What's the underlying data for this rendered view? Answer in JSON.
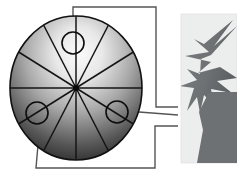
{
  "figure": {
    "width": 237,
    "height": 176,
    "background_color": "#ffffff"
  },
  "colors": {
    "background": "#ffffff",
    "disc_light": "#f2f2f2",
    "disc_mid": "#9a9a9a",
    "disc_dark": "#2b2b2b",
    "disc_edge": "#111111",
    "sector_line": "#141414",
    "marker_circle_stroke": "#0d0d0d",
    "callout_line": "#555555",
    "panel_fill": "#eceded",
    "panel_edge": "#e3e4e4",
    "burst_fill": "#6e7173",
    "burst_fill_dark": "#5d6063"
  },
  "disc": {
    "name": "sectored-disc",
    "center_x": 76,
    "center_y": 88,
    "radius_x": 66,
    "radius_y": 72,
    "sector_count": 12,
    "hub_radius": 3,
    "gradient": {
      "type": "radial",
      "highlight_x": 82,
      "highlight_y": 52,
      "stops": [
        {
          "offset": 0.0,
          "color": "#fbfbfb"
        },
        {
          "offset": 0.22,
          "color": "#e8e8e8"
        },
        {
          "offset": 0.5,
          "color": "#a8a8a8"
        },
        {
          "offset": 0.78,
          "color": "#565656"
        },
        {
          "offset": 1.0,
          "color": "#1f1f1f"
        }
      ]
    },
    "sector_angles_deg": [
      90,
      120,
      150,
      180,
      210,
      240,
      270,
      300,
      330,
      0,
      30,
      60
    ]
  },
  "markers": [
    {
      "name": "marker-circle-top",
      "label": "1",
      "cx": 73,
      "cy": 43,
      "r": 11
    },
    {
      "name": "marker-circle-lower-left",
      "label": "2",
      "cx": 37,
      "cy": 113,
      "r": 11
    },
    {
      "name": "marker-circle-lower-right",
      "label": "3",
      "cx": 117,
      "cy": 112,
      "r": 11
    }
  ],
  "callouts": [
    {
      "name": "callout-top",
      "from_marker": "marker-circle-top",
      "path": "M 73 34 L 73 7 L 156 7 L 156 107 L 178 107",
      "terminal_x": 178,
      "terminal_y": 107
    },
    {
      "name": "callout-right",
      "from_marker": "marker-circle-lower-right",
      "path": "M 126 110 L 178 115",
      "terminal_x": 178,
      "terminal_y": 115
    },
    {
      "name": "callout-bottom",
      "from_marker": "marker-circle-lower-left",
      "path": "M 40 122 L 36 168 L 155 168 L 155 126 L 178 126",
      "terminal_x": 178,
      "terminal_y": 126
    }
  ],
  "inset_panel": {
    "name": "starburst-inset-panel",
    "x": 181,
    "y": 14,
    "width": 56,
    "height": 149
  },
  "burst": {
    "name": "starburst-shape",
    "description": "irregular dark gray explosion/star burst, cropped at panel right edge",
    "points": "237,28 213,47 231,22 203,45 193,40 208,52 186,56 210,62 197,72 219,66 237,79 216,80 231,92 210,88 213,104 203,94 199,112 196,96 186,110 193,88 180,86 196,80 186,70 199,74 200,60 210,56"
  }
}
